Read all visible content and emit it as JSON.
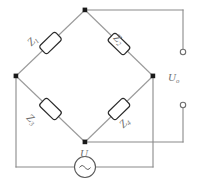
{
  "diagram": {
    "type": "schematic",
    "colors": {
      "wire": "#8a8a8a",
      "node": "#1a1a1a",
      "component_outline": "#2a2a2a",
      "label_text": "#707070",
      "background": "#ffffff"
    },
    "components": {
      "impedances": [
        {
          "id": "z1",
          "label": "Z",
          "subscript": "1",
          "position": "upper-left-branch",
          "icon": "resistor-box-icon"
        },
        {
          "id": "z2",
          "label": "Z",
          "subscript": "2",
          "position": "upper-right-branch",
          "icon": "resistor-box-icon"
        },
        {
          "id": "z3",
          "label": "Z",
          "subscript": "3",
          "position": "lower-left-branch",
          "icon": "resistor-box-icon"
        },
        {
          "id": "z4",
          "label": "Z",
          "subscript": "4",
          "position": "lower-right-branch",
          "icon": "resistor-box-icon"
        }
      ],
      "source": {
        "id": "source-u",
        "label": "U",
        "subscript": "",
        "symbol": "ac-source-icon",
        "wave_glyph": "~",
        "position": "bottom-loop"
      },
      "output": {
        "id": "output-uo",
        "label": "U",
        "subscript": "o",
        "terminals": 2,
        "terminal_icon": "open-terminal-icon",
        "position": "right-side"
      }
    },
    "nodes": [
      {
        "id": "node-top",
        "label": "",
        "icon": "junction-dot-icon"
      },
      {
        "id": "node-left",
        "label": "",
        "icon": "junction-dot-icon"
      },
      {
        "id": "node-right",
        "label": "",
        "icon": "junction-dot-icon"
      },
      {
        "id": "node-bottom",
        "label": "",
        "icon": "junction-dot-icon"
      }
    ]
  }
}
